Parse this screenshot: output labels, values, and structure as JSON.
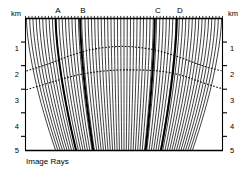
{
  "figure": {
    "caption": "Image Rays",
    "unit_left": "km",
    "unit_right": "km",
    "depth_ticks_left": [
      "1",
      "2",
      "3",
      "4",
      "5"
    ],
    "depth_ticks_right": [
      "1",
      "2",
      "3",
      "4",
      "5"
    ],
    "station_labels": [
      "A",
      "B",
      "C",
      "D"
    ],
    "ink_color": "#000000",
    "background_color": "#ffffff"
  },
  "chart_data": {
    "type": "line",
    "title": "Image Rays",
    "xlabel": "km",
    "ylabel": "km",
    "ylim": [
      0,
      5.6
    ],
    "xlim": [
      0,
      11.0
    ],
    "grid": false,
    "legend": "none",
    "y_ticks": [
      1,
      2,
      3,
      4,
      5
    ],
    "station_markers": [
      {
        "label": "A",
        "x_surface": 1.68,
        "x_bottom": 2.1
      },
      {
        "label": "B",
        "x_surface": 3.05,
        "x_bottom": 3.55
      },
      {
        "label": "C",
        "x_surface": 7.22,
        "x_bottom": 7.1
      },
      {
        "label": "D",
        "x_surface": 8.45,
        "x_bottom": 8.1
      }
    ],
    "ray_count": 60,
    "ray_top_x_start": 0.05,
    "ray_top_x_end": 10.95,
    "ray_description": "Near-vertical image rays launched downward from the surface; rays on the left limb bend to the right with depth and rays on the right limb bend to the left, producing a fan that converges toward the centre of the model.",
    "series": [
      {
        "name": "upper reflector",
        "style": "dashed",
        "x": [
          0.05,
          0.6,
          1.2,
          1.8,
          2.4,
          3.0,
          3.6,
          4.2,
          4.8,
          5.4,
          6.0,
          6.6,
          7.2,
          7.8,
          8.4,
          9.0,
          9.6,
          10.2,
          10.95
        ],
        "y": [
          2.23,
          2.1,
          1.95,
          1.78,
          1.6,
          1.45,
          1.33,
          1.25,
          1.2,
          1.18,
          1.2,
          1.25,
          1.33,
          1.45,
          1.59,
          1.76,
          1.93,
          2.08,
          2.22
        ]
      },
      {
        "name": "lower reflector",
        "style": "dashed",
        "x": [
          0.05,
          0.6,
          1.2,
          1.8,
          2.4,
          3.0,
          3.6,
          4.2,
          4.8,
          5.4,
          6.0,
          6.6,
          7.2,
          7.8,
          8.4,
          9.0,
          9.6,
          10.2,
          10.95
        ],
        "y": [
          3.02,
          2.9,
          2.76,
          2.62,
          2.49,
          2.38,
          2.3,
          2.24,
          2.2,
          2.18,
          2.18,
          2.19,
          2.21,
          2.26,
          2.35,
          2.48,
          2.64,
          2.8,
          2.97
        ]
      }
    ]
  }
}
